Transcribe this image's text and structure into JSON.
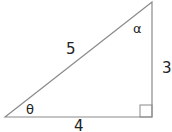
{
  "diagram": {
    "type": "right-triangle",
    "sides": {
      "hypotenuse": "5",
      "vertical": "3",
      "base": "4"
    },
    "angles": {
      "bottom_left": "θ",
      "top_right": "α"
    },
    "right_angle_marker": true,
    "colors": {
      "stroke": "#8a8a8a",
      "text": "#222222"
    }
  }
}
